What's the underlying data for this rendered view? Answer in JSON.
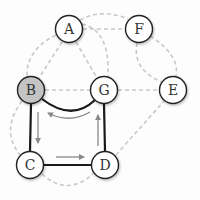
{
  "diagram": {
    "type": "graph",
    "nodes": [
      {
        "id": "A",
        "label": "A",
        "x": 69,
        "y": 29,
        "fill": "#ffffff"
      },
      {
        "id": "F",
        "label": "F",
        "x": 139,
        "y": 29,
        "fill": "#ffffff"
      },
      {
        "id": "B",
        "label": "B",
        "x": 31,
        "y": 90,
        "fill": "#c4c4c4"
      },
      {
        "id": "G",
        "label": "G",
        "x": 104,
        "y": 90,
        "fill": "#ffffff"
      },
      {
        "id": "E",
        "label": "E",
        "x": 173,
        "y": 90,
        "fill": "#ffffff"
      },
      {
        "id": "C",
        "label": "C",
        "x": 30,
        "y": 165,
        "fill": "#ffffff"
      },
      {
        "id": "D",
        "label": "D",
        "x": 105,
        "y": 165,
        "fill": "#ffffff"
      }
    ],
    "edges_dashed": [
      {
        "from": "A",
        "to": "B",
        "shape": "arc-outer"
      },
      {
        "from": "A",
        "to": "B",
        "shape": "straight"
      },
      {
        "from": "A",
        "to": "G",
        "shape": "straight"
      },
      {
        "from": "A",
        "to": "G",
        "shape": "arc"
      },
      {
        "from": "A",
        "to": "F",
        "shape": "straight"
      },
      {
        "from": "A",
        "to": "F",
        "shape": "arc-top"
      },
      {
        "from": "F",
        "to": "E",
        "shape": "arc-outer"
      },
      {
        "from": "F",
        "to": "E",
        "shape": "arc-inner"
      },
      {
        "from": "B",
        "to": "G",
        "shape": "straight"
      },
      {
        "from": "G",
        "to": "E",
        "shape": "straight"
      },
      {
        "from": "B",
        "to": "C",
        "shape": "arc-left"
      },
      {
        "from": "C",
        "to": "D",
        "shape": "arc-bottom"
      },
      {
        "from": "D",
        "to": "E",
        "shape": "straight"
      }
    ],
    "edges_solid": [
      {
        "from": "B",
        "to": "G",
        "shape": "curve-down"
      },
      {
        "from": "B",
        "to": "C",
        "shape": "straight"
      },
      {
        "from": "C",
        "to": "D",
        "shape": "straight"
      },
      {
        "from": "D",
        "to": "G",
        "shape": "straight"
      }
    ],
    "cycle_arrows": [
      {
        "from": "B",
        "to": "C",
        "direction": "down"
      },
      {
        "from": "C",
        "to": "D",
        "direction": "right"
      },
      {
        "from": "D",
        "to": "G",
        "direction": "up"
      },
      {
        "from": "G",
        "to": "B",
        "direction": "left-curved"
      }
    ],
    "highlighted_node": "B",
    "colors": {
      "dashed_edge": "#c8c8c8",
      "solid_edge": "#1a1a1a",
      "arrow": "#8a8a8a",
      "highlight_fill": "#c4c4c4",
      "node_fill": "#ffffff"
    }
  }
}
